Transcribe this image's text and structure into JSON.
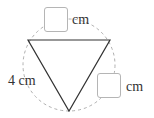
{
  "figure": {
    "type": "inscribed-equilateral-triangle",
    "orientation": "inverted",
    "circle": {
      "style": "dashed",
      "color": "#b0b0b0"
    },
    "triangle_stroke_color": "#333333"
  },
  "labels": {
    "left_side": "4 cm",
    "top_side_unit": "cm",
    "right_side_unit": "cm"
  },
  "answer_boxes": {
    "top": {
      "value": ""
    },
    "right": {
      "value": ""
    }
  }
}
